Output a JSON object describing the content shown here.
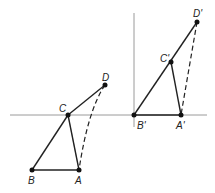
{
  "diagram": {
    "left_figure": {
      "labels": {
        "A": "A",
        "B": "B",
        "C": "C",
        "D": "D"
      }
    },
    "right_figure": {
      "labels": {
        "A": "A'",
        "B": "B'",
        "C": "C'",
        "D": "D'"
      }
    },
    "colors": {
      "line": "#222222",
      "axis": "#999999"
    }
  }
}
